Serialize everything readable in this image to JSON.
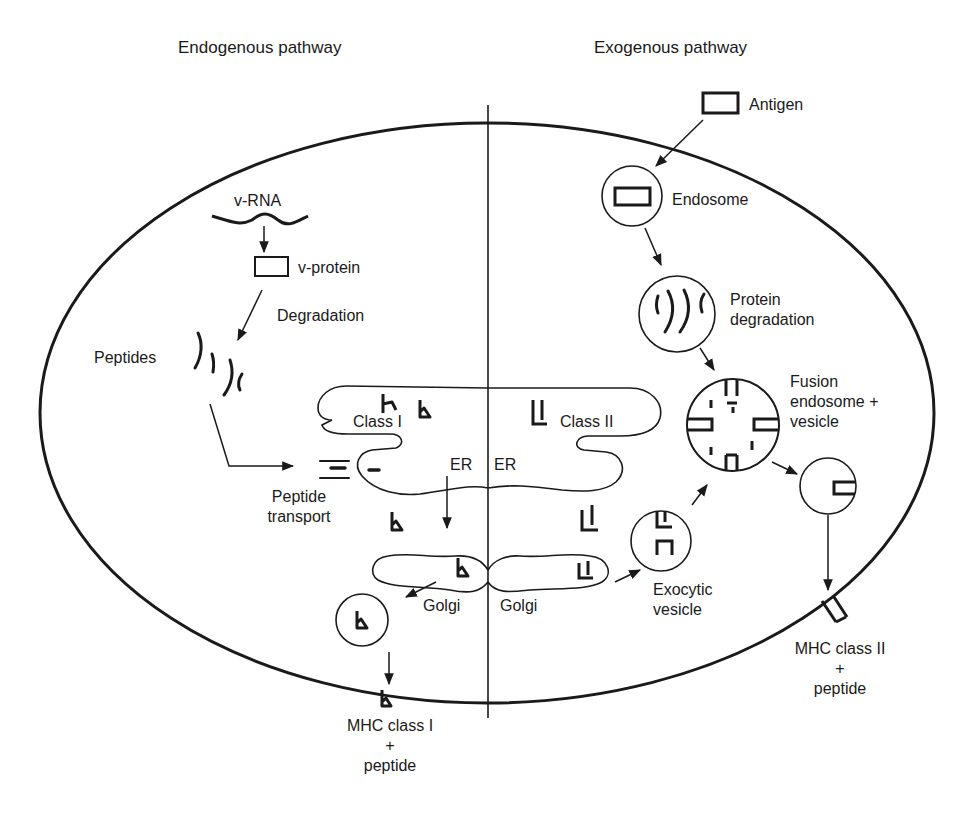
{
  "headings": {
    "left": "Endogenous pathway",
    "right": "Exogenous pathway"
  },
  "endogenous": {
    "v_rna": "v-RNA",
    "v_protein": "v-protein",
    "degradation": "Degradation",
    "peptides": "Peptides",
    "peptide_transport_line1": "Peptide",
    "peptide_transport_line2": "transport",
    "class_label": "Class I",
    "er": "ER",
    "golgi": "Golgi",
    "result_line1": "MHC class I",
    "result_line2": "+",
    "result_line3": "peptide"
  },
  "exogenous": {
    "antigen": "Antigen",
    "endosome": "Endosome",
    "protein_degradation_line1": "Protein",
    "protein_degradation_line2": "degradation",
    "fusion_line1": "Fusion",
    "fusion_line2": "endosome +",
    "fusion_line3": "vesicle",
    "class_label": "Class II",
    "er": "ER",
    "golgi": "Golgi",
    "exocytic_line1": "Exocytic",
    "exocytic_line2": "vesicle",
    "result_line1": "MHC class II",
    "result_line2": "+",
    "result_line3": "peptide"
  },
  "colors": {
    "stroke": "#1a1a1a",
    "background": "#ffffff"
  }
}
